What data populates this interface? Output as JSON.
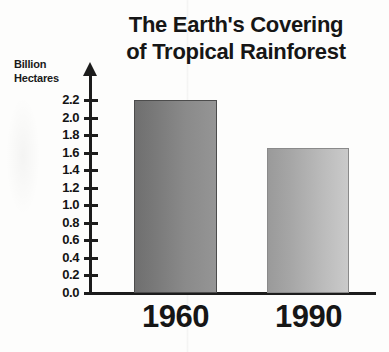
{
  "chart_data": {
    "type": "bar",
    "title": "The Earth's Covering of Tropical Rainforest",
    "title_lines": [
      "The Earth's Covering",
      "of Tropical Rainforest"
    ],
    "categories": [
      "1960",
      "1990"
    ],
    "values": [
      2.2,
      1.65
    ],
    "xlabel": "",
    "ylabel": "Billion Hectares",
    "ylabel_lines": [
      "Billion",
      "Hectares"
    ],
    "ylim": [
      0.0,
      2.2
    ],
    "ytick_step": 0.2,
    "yticks": [
      "2.2",
      "2.0",
      "1.8",
      "1.6",
      "1.4",
      "1.2",
      "1.0",
      "0.8",
      "0.6",
      "0.4",
      "0.2",
      "0.0"
    ],
    "ytick_values": [
      2.2,
      2.0,
      1.8,
      1.6,
      1.4,
      1.2,
      1.0,
      0.8,
      0.6,
      0.4,
      0.2,
      0.0
    ],
    "grid": false,
    "legend": null,
    "legend_position": "none",
    "series": [
      {
        "name": "Tropical rainforest area",
        "values": [
          2.2,
          1.65
        ],
        "bar_colors": [
          "#7e7e7e",
          "#b0b0b0"
        ]
      }
    ],
    "bars": [
      {
        "category": "1960",
        "value": 2.2,
        "color_left": "#6f6f6f",
        "color_right": "#959595"
      },
      {
        "category": "1990",
        "value": 1.65,
        "color_left": "#9a9a9a",
        "color_right": "#cacaca"
      }
    ],
    "axis_color": "#1c1c1c",
    "text_color": "#161616",
    "background_color": "#fdfdfc",
    "y_axis_has_arrow": true
  }
}
